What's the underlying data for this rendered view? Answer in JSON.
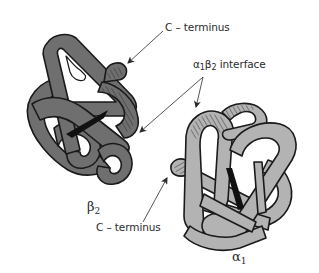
{
  "figure": {
    "colors": {
      "beta_subunit_fill": "#6f6f6f",
      "alpha_subunit_fill": "#b3b3b3",
      "outline": "#1a1a1a",
      "heme": "#111111",
      "hatch": "#2a2a2a",
      "text": "#2a2a2a",
      "background": "#ffffff"
    }
  },
  "labels": {
    "c_terminus_top": {
      "text": "C – terminus"
    },
    "interface": {
      "prefix": "α",
      "sub1": "1",
      "mid": "β",
      "sub2": "2",
      "suffix": " interface"
    },
    "c_terminus_bottom": {
      "text": "C – terminus"
    },
    "beta2": {
      "symbol": "β",
      "sub": "2"
    },
    "alpha1": {
      "symbol": "α",
      "sub": "1"
    }
  },
  "arrows": [
    {
      "name": "c-terminus-top-arrow",
      "from": [
        163,
        31
      ],
      "to": [
        128,
        63
      ]
    },
    {
      "name": "interface-arrow-left",
      "from": [
        203,
        77
      ],
      "to": [
        140,
        132
      ]
    },
    {
      "name": "interface-arrow-right",
      "from": [
        203,
        77
      ],
      "to": [
        196,
        107
      ]
    },
    {
      "name": "c-terminus-bottom-arrow",
      "from": [
        143,
        222
      ],
      "to": [
        167,
        178
      ]
    }
  ]
}
